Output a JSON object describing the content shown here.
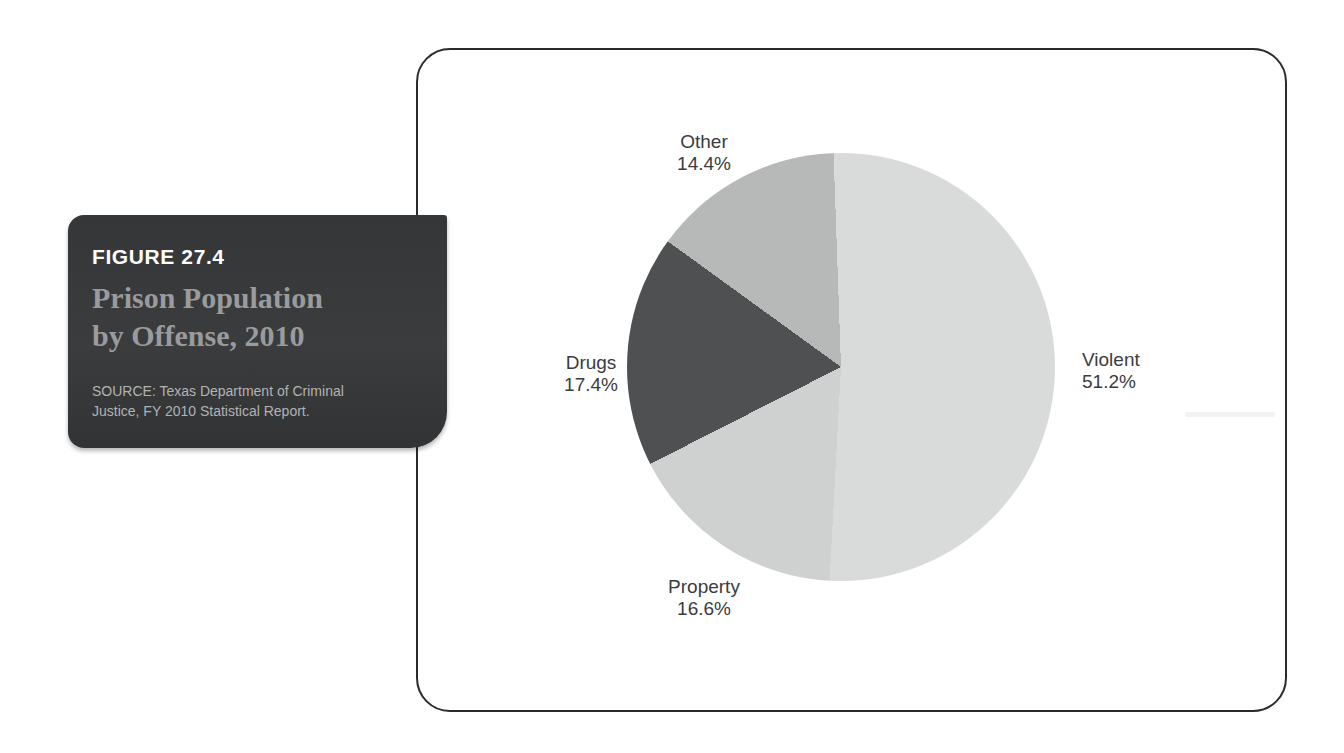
{
  "figure_box": {
    "kicker": "FIGURE 27.4",
    "title_line1": "Prison Population",
    "title_line2": "by Offense, 2010",
    "source_line1": "SOURCE: Texas Department of Criminal",
    "source_line2": "Justice, FY 2010 Statistical Report.",
    "background_color": "#363839",
    "kicker_color": "#fdfdfd",
    "title_color": "#9a9b9c",
    "source_color": "#b2b3b4"
  },
  "chart_data": {
    "type": "pie",
    "title": "Prison Population by Offense, 2010",
    "categories": [
      "Violent",
      "Property",
      "Drugs",
      "Other"
    ],
    "values": [
      51.2,
      16.6,
      17.4,
      14.4
    ],
    "unit": "%",
    "start_angle_deg": -2,
    "direction": "clockwise-from-top",
    "legend_position": "labels-outside",
    "slices": [
      {
        "label": "Violent",
        "pct": "51.2%",
        "value": 51.2,
        "color": "#d9dbda"
      },
      {
        "label": "Property",
        "pct": "16.6%",
        "value": 16.6,
        "color": "#cfd1d0"
      },
      {
        "label": "Drugs",
        "pct": "17.4%",
        "value": 17.4,
        "color": "#4e5051"
      },
      {
        "label": "Other",
        "pct": "14.4%",
        "value": 14.4,
        "color": "#b7b9b8"
      }
    ]
  }
}
